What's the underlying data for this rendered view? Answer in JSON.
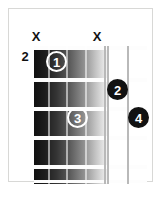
{
  "diagram": {
    "type": "guitar-chord-diagram",
    "fret_position_label": "2",
    "frets_shown": 5,
    "strings_shown": 6,
    "mute_marker_glyph": "X",
    "mute_markers": [
      {
        "label": "X",
        "string": 1,
        "x": 21
      },
      {
        "label": "X",
        "string": 4,
        "x": 82
      }
    ],
    "fingerings": [
      {
        "label": "1",
        "string": 2,
        "fret": 1,
        "style": "open",
        "x": 37,
        "y": 42
      },
      {
        "label": "2",
        "string": 5,
        "fret": 2,
        "style": "solid",
        "x": 98,
        "y": 70
      },
      {
        "label": "3",
        "string": 3,
        "fret": 3,
        "style": "open",
        "x": 58,
        "y": 98
      },
      {
        "label": "4",
        "string": 6,
        "fret": 3,
        "style": "solid",
        "x": 119,
        "y": 98
      }
    ],
    "colors": {
      "frame": "#d8d8d6",
      "board_dark": "#111111",
      "board_light": "#fbfbfb",
      "fret_line": "#fdfdfd",
      "string_light": "#b9b9b9",
      "marker_fill": "#121212",
      "marker_text": "#ffffff",
      "text": "#131313",
      "background": "#ffffff"
    }
  }
}
